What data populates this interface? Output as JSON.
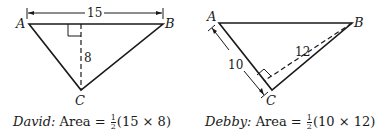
{
  "left_figure": {
    "vertices": {
      "A": "A",
      "B": "B",
      "C": "C"
    },
    "base_length": "15",
    "height_length": "8",
    "caption": {
      "name": "David:",
      "prefix": "Area =",
      "frac_num": "1",
      "frac_den": "2",
      "expr": "(15 × 8)"
    }
  },
  "right_figure": {
    "vertices": {
      "A": "A",
      "B": "B",
      "C": "C"
    },
    "side_length": "10",
    "height_length": "12",
    "caption": {
      "name": "Debby:",
      "prefix": "Area =",
      "frac_num": "1",
      "frac_den": "2",
      "expr": "(10 × 12)"
    }
  },
  "colors": {
    "ink": "#1a1a1a",
    "background": "#ffffff"
  }
}
